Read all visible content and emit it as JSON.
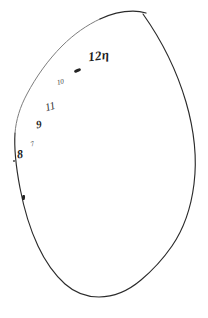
{
  "document": {
    "title": "Hand-drawn closed outline with pencil annotations",
    "medium": "pencil on white paper scan",
    "background_color": "#ffffff",
    "ink_color": "#2b2b2b",
    "width_px": 208,
    "height_px": 318
  },
  "figure": {
    "name": "closed-teardrop-outline",
    "stroke_color": "#2b2b2b",
    "stroke_width": 1.1,
    "fill": "none",
    "cusp_point": {
      "x": 143,
      "y": 14
    }
  },
  "annotations": [
    {
      "id": "a1",
      "name": "label-12n",
      "text": "12η",
      "x": 88,
      "y": 49,
      "rotation": -7,
      "size": "large"
    },
    {
      "id": "a2",
      "name": "label-10",
      "text": "10",
      "x": 57,
      "y": 79,
      "rotation": -12,
      "size": "small"
    },
    {
      "id": "a3",
      "name": "label-11",
      "text": "11",
      "x": 45,
      "y": 101,
      "rotation": -16,
      "size": "medium"
    },
    {
      "id": "a4",
      "name": "label-9",
      "text": "9",
      "x": 36,
      "y": 119,
      "rotation": -10,
      "size": "medium"
    },
    {
      "id": "a5",
      "name": "label-7",
      "text": "7",
      "x": 31,
      "y": 141,
      "rotation": -20,
      "size": "small"
    },
    {
      "id": "a6",
      "name": "label-8",
      "text": "8",
      "x": 17,
      "y": 148,
      "rotation": -8,
      "size": "medium"
    }
  ],
  "tick_marks": [
    {
      "id": "t1",
      "name": "tick-mark-upper",
      "x": 74,
      "y": 69,
      "rotation": -24
    },
    {
      "id": "t2",
      "name": "tick-mark-lower",
      "x": 22,
      "y": 195,
      "rotation": 6
    },
    {
      "id": "t3",
      "name": "tick-dot-left",
      "x": 13,
      "y": 160,
      "rotation": 0
    }
  ]
}
